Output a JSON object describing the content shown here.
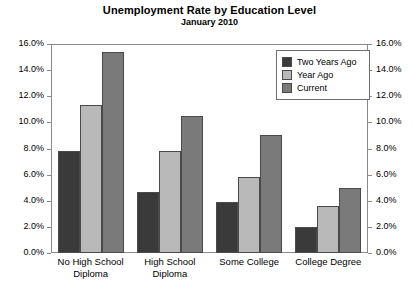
{
  "chart_data": {
    "type": "bar",
    "title": "Unemployment Rate by Education Level",
    "subtitle": "January 2010",
    "xlabel": "",
    "ylabel": "",
    "ylim": [
      0,
      16
    ],
    "ytick_step": 2,
    "ytick_labels": [
      "0.0%",
      "2.0%",
      "4.0%",
      "6.0%",
      "8.0%",
      "10.0%",
      "12.0%",
      "14.0%",
      "16.0%"
    ],
    "ytick_labels_right": [
      "0.0%",
      "2.0%",
      "4.0%",
      "6.0%",
      "8.0%",
      "10.0%",
      "12.0%",
      "14.0%",
      "16.0%"
    ],
    "grid": false,
    "dual_axis": true,
    "legend_position": "top-right",
    "categories": [
      "No High School Diploma",
      "High School Diploma",
      "Some College",
      "College Degree"
    ],
    "series": [
      {
        "name": "Two Years Ago",
        "color": "#3a3a3a",
        "values": [
          7.8,
          4.7,
          3.9,
          2.0
        ]
      },
      {
        "name": "Year Ago",
        "color": "#b9b9b9",
        "values": [
          11.3,
          7.8,
          5.8,
          3.6
        ]
      },
      {
        "name": "Current",
        "color": "#7a7a7a",
        "values": [
          15.4,
          10.5,
          9.0,
          5.0
        ]
      }
    ]
  }
}
